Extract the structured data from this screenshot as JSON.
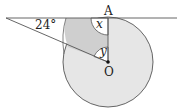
{
  "diagram": {
    "type": "geometry-circle-tangent",
    "labels": {
      "point_a": "A",
      "point_o": "O",
      "angle_given": "24°",
      "angle_x": "x",
      "angle_y": "y"
    },
    "colors": {
      "circle_fill": "#e6e6e6",
      "shaded_fill": "#cfcfcf",
      "stroke": "#555555"
    }
  }
}
